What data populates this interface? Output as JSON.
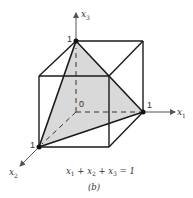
{
  "figure": {
    "caption": "(b)",
    "equation": {
      "t1": "x",
      "s1": "1",
      "p1": " + ",
      "t2": "x",
      "s2": "2",
      "p2": " + ",
      "t3": "x",
      "s3": "3",
      "rhs": " = 1"
    },
    "axes": {
      "x1": {
        "name": "x",
        "sub": "1"
      },
      "x2": {
        "name": "x",
        "sub": "2"
      },
      "x3": {
        "name": "x",
        "sub": "3"
      }
    },
    "point_labels": {
      "origin": "0",
      "x1_unit": "1",
      "x2_unit": "1",
      "x3_unit": "1"
    },
    "colors": {
      "edge": "#1a1a1a",
      "axis": "#555555",
      "simplex_fill": "#d9d9d9",
      "vertex": "#111111"
    }
  }
}
